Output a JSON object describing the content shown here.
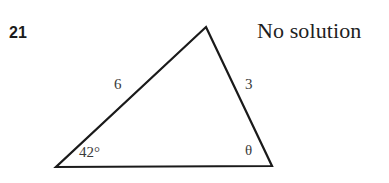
{
  "problem": {
    "number": "21",
    "answer": "No solution"
  },
  "figure": {
    "type": "triangle",
    "vertices": {
      "apex": {
        "x": 206,
        "y": 27
      },
      "bottom_left": {
        "x": 56,
        "y": 167
      },
      "bottom_right": {
        "x": 272,
        "y": 166
      }
    },
    "stroke_color": "#1a1a1a",
    "stroke_width": 2,
    "labels": {
      "side_left": "6",
      "side_right": "3",
      "angle_left": "42°",
      "angle_right": "θ"
    }
  },
  "colors": {
    "background": "#ffffff",
    "ink": "#1b1b1b",
    "label_gray": "#3a3a3a"
  }
}
